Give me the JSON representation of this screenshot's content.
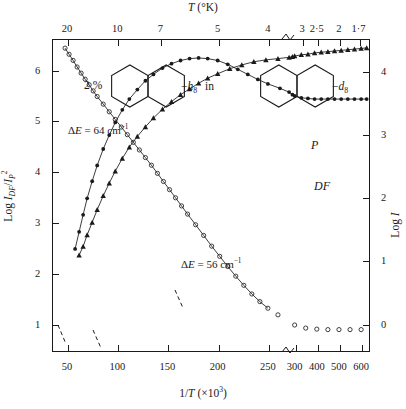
{
  "figure": {
    "top_axis_title": "T (°K)",
    "bottom_axis_title": "1/T (×10³)",
    "left_axis_title": "Log I_DF/I_P²",
    "right_axis_title": "Log I"
  },
  "annotations": {
    "percent": "2 %",
    "host_label": "−h₈",
    "in_word": "in",
    "guest_label": "−d₈",
    "delta_e_upper": "ΔE = 64 cm⁻¹",
    "delta_e_lower": "ΔE = 56 cm⁻¹",
    "curve_label_p": "P",
    "curve_label_df": "DF"
  },
  "chart_data": {
    "type": "scatter",
    "title": "",
    "xlabel": "1/T (×10³)",
    "ylabel": "Log I_DF/I_P²",
    "ylabel_right": "Log I",
    "xlabel_top": "T (°K)",
    "grid": false,
    "legend": "inline-annotation",
    "axis_break_bottom_between": [
      250,
      300
    ],
    "axis_break_top_between": [
      4,
      3
    ],
    "xticks_bottom": [
      "50",
      "100",
      "150",
      "200",
      "250",
      "300",
      "400",
      "500",
      "600"
    ],
    "xticks_top": [
      "20",
      "10",
      "7",
      "5",
      "4",
      "3",
      "2·5",
      "2",
      "1·7"
    ],
    "yticks_left": [
      "1",
      "2",
      "3",
      "4",
      "5",
      "6"
    ],
    "yticks_right": [
      "0",
      "1",
      "2",
      "3",
      "4"
    ],
    "ylim_left": [
      0.45,
      6.6
    ],
    "ylim_right": [
      -0.45,
      4.5
    ],
    "xlim": [
      35,
      640
    ],
    "series": [
      {
        "name": "Log I_DF/I_P^2",
        "marker": "open-circle",
        "axis": "left",
        "annotation": "ΔE = 64 cm⁻¹ (upper slope), ΔE = 56 cm⁻¹ (lower slope)",
        "x": [
          48,
          52,
          56,
          60,
          64,
          68,
          72,
          76,
          80,
          86,
          92,
          98,
          104,
          110,
          116,
          122,
          128,
          134,
          140,
          146,
          152,
          158,
          164,
          170,
          178,
          186,
          194,
          202,
          210,
          218,
          226,
          234,
          242,
          250,
          260,
          300,
          350,
          400,
          450,
          500,
          550,
          600
        ],
        "y": [
          6.42,
          6.3,
          6.18,
          6.05,
          5.93,
          5.81,
          5.7,
          5.58,
          5.47,
          5.32,
          5.17,
          5.02,
          4.87,
          4.72,
          4.57,
          4.42,
          4.27,
          4.12,
          3.96,
          3.8,
          3.64,
          3.48,
          3.32,
          3.16,
          2.95,
          2.74,
          2.53,
          2.33,
          2.13,
          1.94,
          1.76,
          1.59,
          1.44,
          1.31,
          1.18,
          0.98,
          0.92,
          0.9,
          0.89,
          0.89,
          0.89,
          0.89
        ]
      },
      {
        "name": "DF",
        "marker": "filled-circle",
        "axis": "right",
        "x": [
          58,
          62,
          66,
          70,
          75,
          80,
          86,
          92,
          98,
          105,
          112,
          120,
          128,
          136,
          145,
          154,
          163,
          172,
          181,
          190,
          200,
          210,
          220,
          230,
          240,
          250,
          262,
          275,
          290,
          300,
          330,
          360,
          390,
          420,
          450,
          480,
          510,
          540,
          570,
          600,
          625
        ],
        "y": [
          1.18,
          1.45,
          1.72,
          1.98,
          2.25,
          2.5,
          2.76,
          2.98,
          3.18,
          3.38,
          3.55,
          3.7,
          3.84,
          3.94,
          4.04,
          4.11,
          4.16,
          4.19,
          4.2,
          4.19,
          4.16,
          4.1,
          4.02,
          3.94,
          3.86,
          3.79,
          3.72,
          3.66,
          3.62,
          3.6,
          3.57,
          3.56,
          3.55,
          3.55,
          3.55,
          3.55,
          3.55,
          3.55,
          3.55,
          3.55,
          3.55
        ]
      },
      {
        "name": "P",
        "marker": "filled-triangle",
        "axis": "right",
        "x": [
          62,
          66,
          70,
          75,
          80,
          86,
          92,
          98,
          105,
          112,
          120,
          128,
          136,
          145,
          154,
          163,
          172,
          181,
          190,
          200,
          212,
          224,
          236,
          248,
          260,
          275,
          290,
          300,
          330,
          360,
          390,
          420,
          450,
          480,
          510,
          540,
          570,
          600,
          625
        ],
        "y": [
          1.08,
          1.22,
          1.4,
          1.6,
          1.8,
          2.02,
          2.22,
          2.41,
          2.61,
          2.79,
          2.96,
          3.11,
          3.25,
          3.39,
          3.51,
          3.62,
          3.71,
          3.8,
          3.88,
          3.95,
          4.03,
          4.09,
          4.14,
          4.17,
          4.19,
          4.21,
          4.22,
          4.23,
          4.25,
          4.26,
          4.28,
          4.29,
          4.3,
          4.31,
          4.32,
          4.33,
          4.34,
          4.35,
          4.36
        ]
      }
    ]
  }
}
